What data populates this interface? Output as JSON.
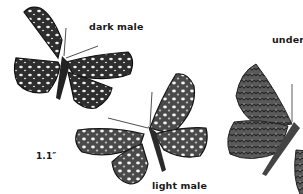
{
  "figure": {
    "labels": {
      "dark_male": "dark male",
      "underside": "unders",
      "light_male": "light male",
      "size": "1.1″"
    },
    "specimens": [
      {
        "name": "dark-male",
        "view": "upperside"
      },
      {
        "name": "light-male",
        "view": "upperside"
      },
      {
        "name": "underside",
        "view": "underside"
      }
    ],
    "colors": {
      "ink": "#1a1a1a",
      "wing_dark": "#2b2b2b",
      "wing_mid": "#6a6a6a",
      "spot": "#f2f2f2",
      "background": "#ffffff"
    }
  }
}
